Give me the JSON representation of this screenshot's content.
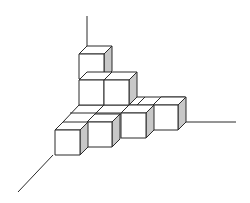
{
  "figure": {
    "colors": {
      "stroke": "#2a2a2a",
      "front_face": "#ffffff",
      "side_face": "#c8c8c8",
      "background": "#ffffff"
    },
    "cube_size": 25,
    "depth_offset": [
      8,
      -8
    ],
    "axes": [
      {
        "name": "vertical-axis",
        "x1": 87,
        "y1": 16,
        "x2": 87,
        "y2": 46
      },
      {
        "name": "right-axis",
        "x1": 185,
        "y1": 122,
        "x2": 236,
        "y2": 122
      },
      {
        "name": "left-axis",
        "x1": 53,
        "y1": 155,
        "x2": 18,
        "y2": 192
      }
    ],
    "cubes": [
      {
        "name": "tower-top-cube",
        "x": 79,
        "y": 54
      },
      {
        "name": "tower-bottom-cube",
        "x": 79,
        "y": 80
      },
      {
        "name": "tower-right-cube",
        "x": 104,
        "y": 80
      },
      {
        "name": "front-row-cube-4",
        "x": 153,
        "y": 105
      },
      {
        "name": "front-row-cube-3",
        "x": 121,
        "y": 113
      },
      {
        "name": "front-row-cube-2",
        "x": 87,
        "y": 122
      },
      {
        "name": "front-row-cube-1",
        "x": 55,
        "y": 130
      }
    ]
  }
}
